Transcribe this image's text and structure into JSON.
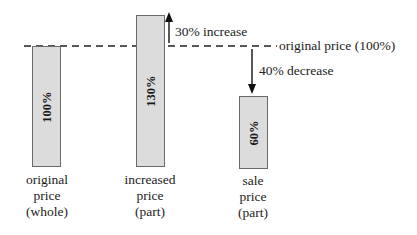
{
  "diagram": {
    "reference_line": {
      "label": "original price (100%)",
      "style": "dashed"
    },
    "bars": [
      {
        "value_label": "100%",
        "caption": [
          "original",
          "price",
          "(whole)"
        ]
      },
      {
        "value_label": "130%",
        "caption": [
          "increased",
          "price",
          "(part)"
        ]
      },
      {
        "value_label": "60%",
        "caption": [
          "sale",
          "price",
          "(part)"
        ]
      }
    ],
    "annotations": {
      "increase": "30% increase",
      "decrease": "40% decrease"
    },
    "colors": {
      "bar_fill": "#dcdcdc",
      "bar_border": "#6a6a6a",
      "line": "#222222"
    }
  }
}
